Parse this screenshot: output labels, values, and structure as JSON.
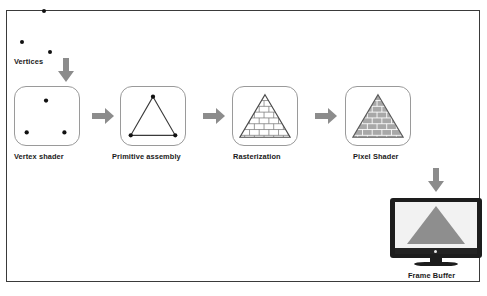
{
  "diagram": {
    "input_label": "Vertices",
    "stages": [
      {
        "id": "vertex-shader",
        "label": "Vertex shader",
        "content": "three-scattered-vertices"
      },
      {
        "id": "primitive-assembly",
        "label": "Primitive assembly",
        "content": "triangle-outline-with-vertex-dots"
      },
      {
        "id": "rasterization",
        "label": "Rasterization",
        "content": "triangle-with-white-grid-fragments"
      },
      {
        "id": "pixel-shader",
        "label": "Pixel Shader",
        "content": "triangle-with-gray-shaded-fragments"
      }
    ],
    "output": {
      "id": "frame-buffer",
      "label": "Frame Buffer",
      "content": "monitor-displaying-solid-gray-triangle"
    },
    "arrows": [
      {
        "name": "vertices-to-vertex-shader",
        "direction": "down"
      },
      {
        "name": "vertex-shader-to-primitive-assembly",
        "direction": "right"
      },
      {
        "name": "primitive-assembly-to-rasterization",
        "direction": "right"
      },
      {
        "name": "rasterization-to-pixel-shader",
        "direction": "right"
      },
      {
        "name": "pixel-shader-to-frame-buffer",
        "direction": "down"
      }
    ],
    "input_vertices": [
      {
        "x": 42,
        "y": 10
      },
      {
        "x": 20,
        "y": 41
      },
      {
        "x": 48,
        "y": 51
      }
    ],
    "colors": {
      "arrow": "#8c8c8c",
      "stage_border": "#9a9a9a",
      "frame_border": "#3a3a3a",
      "vertex_dot": "#111111",
      "triangle_outline": "#3a3a3a",
      "fragment_fill": "#a8a8a8",
      "monitor_body": "#1d1d1d",
      "monitor_screen": "#f2f2f2",
      "display_triangle": "#8e8e8e",
      "background": "#ffffff",
      "text": "#1a1a1a"
    }
  }
}
